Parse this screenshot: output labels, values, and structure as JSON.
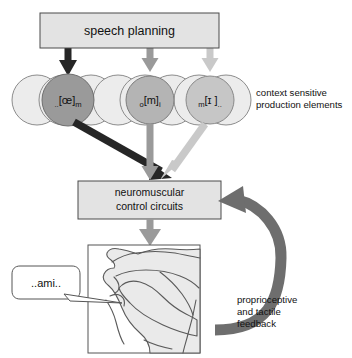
{
  "diagram": {
    "top_box": {
      "label": "speech planning"
    },
    "control_box": {
      "line1": "neuromuscular",
      "line2": "control circuits"
    },
    "side_label": {
      "line1": "context sensitive",
      "line2": "production elements"
    },
    "feedback_label": {
      "line1": "proprioceptive",
      "line2": "and tactile",
      "line3": "feedback"
    },
    "speech_bubble": {
      "text": "..ami.."
    },
    "production_elements": [
      {
        "id": "elem-1",
        "pre": "..",
        "core": "[œ]",
        "post": "m",
        "shade": "#9a9a9a"
      },
      {
        "id": "elem-2",
        "pre": "o",
        "core": "[m]",
        "post": "i",
        "shade": "#b4b4b4"
      },
      {
        "id": "elem-3",
        "pre": "m",
        "core": "[ɪ ]",
        "post": "..",
        "shade": "#c6c6c6"
      }
    ],
    "colors": {
      "arrow_dark": "#262626",
      "arrow_mid": "#9a9a9a",
      "arrow_light": "#c9c9c9",
      "feedback_arrow": "#6e6e6e",
      "box_fill": "#e3e3e3",
      "box_stroke": "#4a4a4a",
      "pale_circle_fill": "#ececec",
      "circle_stroke": "#8c8c8c",
      "text": "#111111"
    }
  }
}
